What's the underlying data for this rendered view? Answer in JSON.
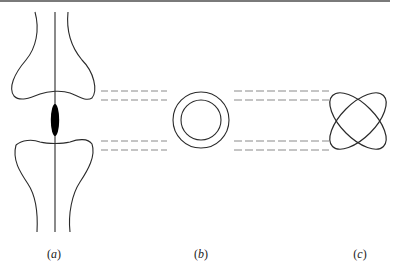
{
  "figure": {
    "panels": [
      {
        "id": "a",
        "label": "(a)",
        "letter": "a",
        "description": "joint cross-section with vertical axis line and dark ellipse between two bone ends"
      },
      {
        "id": "b",
        "label": "(b)",
        "letter": "b",
        "description": "two concentric circles (ring)"
      },
      {
        "id": "c",
        "label": "(c)",
        "letter": "c",
        "description": "two crossed ellipses rotated ±45°"
      }
    ],
    "connector_style": "dashed",
    "colors": {
      "stroke": "#2a2a2a",
      "dash": "#8a8a8a",
      "fill_ellipse": "#000000",
      "top_rule": "#7a7a7a"
    }
  }
}
